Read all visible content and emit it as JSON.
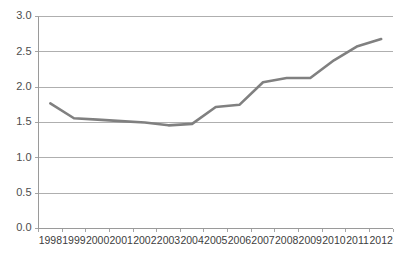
{
  "chart_data": {
    "type": "line",
    "title": "",
    "subtitle": "",
    "xlabel": "",
    "ylabel": "",
    "categories": [
      "1998",
      "1999",
      "2000",
      "2001",
      "2002",
      "2003",
      "2004",
      "2005",
      "2006",
      "2007",
      "2008",
      "2009",
      "2010",
      "2011",
      "2012"
    ],
    "values": [
      1.77,
      1.56,
      1.54,
      1.52,
      1.5,
      1.46,
      1.48,
      1.72,
      1.75,
      2.07,
      2.13,
      2.13,
      2.38,
      2.58,
      2.68
    ],
    "series": [
      {
        "name": "",
        "values": [
          1.77,
          1.56,
          1.54,
          1.52,
          1.5,
          1.46,
          1.48,
          1.72,
          1.75,
          2.07,
          2.13,
          2.13,
          2.38,
          2.58,
          2.68
        ]
      }
    ],
    "ylim": [
      0.0,
      3.0
    ],
    "ytick_values": [
      0.0,
      0.5,
      1.0,
      1.5,
      2.0,
      2.5,
      3.0
    ],
    "ytick_labels": [
      "0.0",
      "0.5",
      "1.0",
      "1.5",
      "2.0",
      "2.5",
      "3.0"
    ],
    "grid": true,
    "grid_axis": "y",
    "legend": false,
    "legend_position": "none",
    "annotations": []
  },
  "style": {
    "series_color": "#808080",
    "grid_color": "#a6a6a6",
    "axis_color": "#9a9a9a",
    "tick_label_color": "#3d3d3d",
    "ytick_label_color": "#4d4d4d",
    "background": "#ffffff",
    "series_width": "2.6"
  }
}
